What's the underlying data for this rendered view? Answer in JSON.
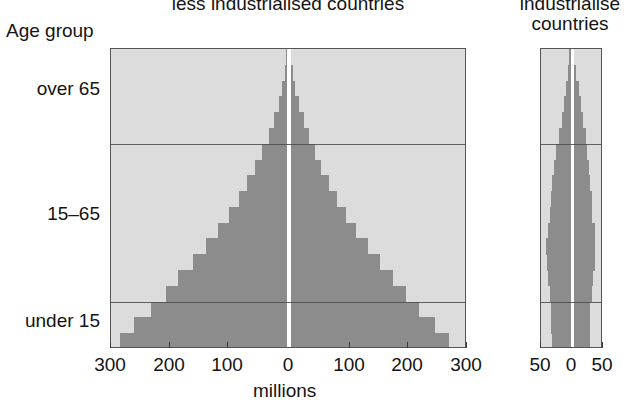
{
  "titles": {
    "main": "less industrialised countries",
    "small": "industrialise\ncountries"
  },
  "labels": {
    "age_group": "Age group",
    "millions": "millions",
    "male": "male",
    "female": "female"
  },
  "age_groups": [
    {
      "label": "over 65"
    },
    {
      "label": "15–65"
    },
    {
      "label": "under 15"
    }
  ],
  "chart_data": {
    "type": "bar",
    "subtype": "population-pyramid",
    "title": "less industrialised countries",
    "xlabel": "millions",
    "ylabel": "Age group",
    "grid": true,
    "legend": [
      "male",
      "female"
    ],
    "legend_position": "inside-bottom",
    "panels": [
      {
        "name": "less industrialised countries",
        "xlim": [
          -300,
          300
        ],
        "xticks": [
          -300,
          -200,
          -100,
          0,
          100,
          200,
          300
        ],
        "xticklabels": [
          "300",
          "200",
          "100",
          "0",
          "100",
          "200",
          "300"
        ],
        "unit": "millions",
        "age_boundaries": [
          15,
          65
        ],
        "bins": [
          {
            "age": "0-5",
            "male": 285,
            "female": 272
          },
          {
            "age": "5-10",
            "male": 260,
            "female": 249
          },
          {
            "age": "10-15",
            "male": 232,
            "female": 222
          },
          {
            "age": "15-20",
            "male": 207,
            "female": 199
          },
          {
            "age": "20-25",
            "male": 185,
            "female": 178
          },
          {
            "age": "25-30",
            "male": 160,
            "female": 155
          },
          {
            "age": "30-35",
            "male": 138,
            "female": 134
          },
          {
            "age": "35-40",
            "male": 117,
            "female": 114
          },
          {
            "age": "40-45",
            "male": 99,
            "female": 97
          },
          {
            "age": "45-50",
            "male": 82,
            "female": 81
          },
          {
            "age": "50-55",
            "male": 68,
            "female": 68
          },
          {
            "age": "55-60",
            "male": 54,
            "female": 55
          },
          {
            "age": "60-65",
            "male": 42,
            "female": 44
          },
          {
            "age": "65-70",
            "male": 31,
            "female": 34
          },
          {
            "age": "70-75",
            "male": 22,
            "female": 25
          },
          {
            "age": "75-80",
            "male": 14,
            "female": 17
          },
          {
            "age": "80-85",
            "male": 8,
            "female": 10
          },
          {
            "age": "85-90",
            "male": 4,
            "female": 6
          },
          {
            "age": "90+",
            "male": 2,
            "female": 3
          }
        ]
      },
      {
        "name": "industrialised countries",
        "xlim": [
          -50,
          50
        ],
        "xticks": [
          -50,
          0,
          50
        ],
        "xticklabels": [
          "50",
          "0",
          "50"
        ],
        "unit": "millions",
        "age_boundaries": [
          15,
          65
        ],
        "bins": [
          {
            "age": "0-5",
            "male": 32,
            "female": 31
          },
          {
            "age": "5-10",
            "male": 33,
            "female": 31
          },
          {
            "age": "10-15",
            "male": 33,
            "female": 32
          },
          {
            "age": "15-20",
            "male": 35,
            "female": 34
          },
          {
            "age": "20-25",
            "male": 38,
            "female": 37
          },
          {
            "age": "25-30",
            "male": 40,
            "female": 39
          },
          {
            "age": "30-35",
            "male": 41,
            "female": 40
          },
          {
            "age": "35-40",
            "male": 39,
            "female": 39
          },
          {
            "age": "40-45",
            "male": 35,
            "female": 35
          },
          {
            "age": "45-50",
            "male": 33,
            "female": 34
          },
          {
            "age": "50-55",
            "male": 31,
            "female": 32
          },
          {
            "age": "55-60",
            "male": 28,
            "female": 30
          },
          {
            "age": "60-65",
            "male": 24,
            "female": 27
          },
          {
            "age": "65-70",
            "male": 20,
            "female": 24
          },
          {
            "age": "70-75",
            "male": 15,
            "female": 20
          },
          {
            "age": "75-80",
            "male": 11,
            "female": 16
          },
          {
            "age": "80-85",
            "male": 7,
            "female": 12
          },
          {
            "age": "85-90",
            "male": 4,
            "female": 8
          },
          {
            "age": "90+",
            "male": 2,
            "female": 4
          }
        ]
      }
    ]
  },
  "colors": {
    "plot_background": "#dcdcdc",
    "bar": "#8c8c8c",
    "frame": "#555555",
    "text": "#141414",
    "page_background": "#ffffff"
  }
}
